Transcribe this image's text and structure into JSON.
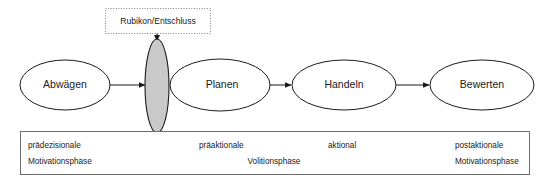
{
  "diagram": {
    "colors": {
      "stroke": "#1a1a1a",
      "rubikon_fill": "#c9c9c9",
      "box_stroke": "#6e6e6e",
      "dotted_stroke": "#808080",
      "background": "#ffffff",
      "text": "#1a1a1a"
    },
    "rubikon_marker": {
      "label": "Rubikon/Entschluss",
      "border_style": "dotted"
    },
    "nodes": [
      {
        "id": "abwaegen",
        "label": "Abwägen",
        "cx": 65,
        "cy": 85,
        "rx": 45,
        "ry": 25
      },
      {
        "id": "rubikon",
        "label": "",
        "cx": 157,
        "cy": 86,
        "rx": 12,
        "ry": 47
      },
      {
        "id": "planen",
        "label": "Planen",
        "cx": 220,
        "cy": 85,
        "rx": 50,
        "ry": 26
      },
      {
        "id": "handeln",
        "label": "Handeln",
        "cx": 344,
        "cy": 85,
        "rx": 52,
        "ry": 25
      },
      {
        "id": "bewerten",
        "label": "Bewerten",
        "cx": 482,
        "cy": 85,
        "rx": 52,
        "ry": 25
      }
    ],
    "connectors": [
      {
        "from": "abwaegen",
        "to": "rubikon"
      },
      {
        "from": "planen",
        "to": "handeln"
      },
      {
        "from": "handeln",
        "to": "bewerten"
      },
      {
        "from": "rubikon_marker",
        "to": "rubikon"
      }
    ],
    "phase_box": {
      "labels": [
        {
          "id": "praedezisionale",
          "line1": "prädezisionale",
          "line2": "Motivationsphase",
          "x": 28,
          "align": "start"
        },
        {
          "id": "praeaktionale",
          "line1": "präaktionale",
          "line2": "",
          "x": 199,
          "align": "start"
        },
        {
          "id": "volitionsphase",
          "line1": "",
          "line2": "Volitionsphase",
          "x": 274,
          "align": "mid"
        },
        {
          "id": "aktional",
          "line1": "aktional",
          "line2": "",
          "x": 328,
          "align": "start"
        },
        {
          "id": "postaktionale",
          "line1": "postaktionale",
          "line2": "Motivationsphase",
          "x": 455,
          "align": "start"
        }
      ]
    }
  }
}
